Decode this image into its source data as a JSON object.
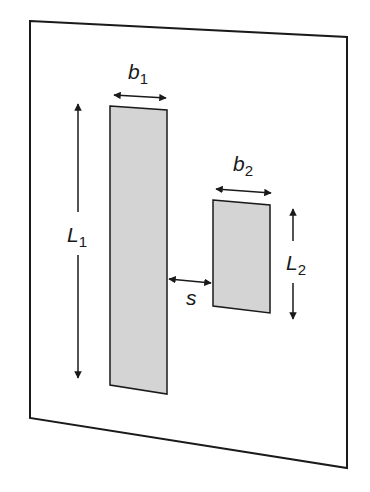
{
  "diagram": {
    "colors": {
      "outline": "#1a1a1a",
      "plate_fill": "#d4d4d4",
      "background": "#ffffff"
    },
    "labels": {
      "b1": {
        "main": "b",
        "sub": "1"
      },
      "b2": {
        "main": "b",
        "sub": "2"
      },
      "L1": {
        "main": "L",
        "sub": "1"
      },
      "L2": {
        "main": "L",
        "sub": "2"
      },
      "s": {
        "main": "s"
      }
    },
    "elements": [
      {
        "id": "substrate",
        "type": "parallelogram"
      },
      {
        "id": "plate-1",
        "type": "rectangle",
        "width_label": "b1",
        "length_label": "L1"
      },
      {
        "id": "plate-2",
        "type": "rectangle",
        "width_label": "b2",
        "length_label": "L2"
      },
      {
        "id": "spacing",
        "type": "double-arrow",
        "label": "s"
      }
    ]
  }
}
